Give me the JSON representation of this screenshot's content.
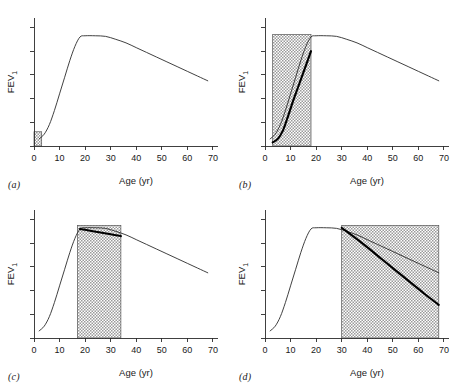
{
  "figure": {
    "panels": [
      {
        "id": "a",
        "label": "(a)",
        "xlabel": "Age (yr)",
        "ylabel": "FEV",
        "ylabel_sub": "1",
        "highlight_label": "early-life-window"
      },
      {
        "id": "b",
        "label": "(b)",
        "xlabel": "Age (yr)",
        "ylabel": "FEV",
        "ylabel_sub": "1",
        "highlight_label": "reduced-growth-window"
      },
      {
        "id": "c",
        "label": "(c)",
        "xlabel": "Age (yr)",
        "ylabel": "FEV",
        "ylabel_sub": "1",
        "highlight_label": "short-plateau-window"
      },
      {
        "id": "d",
        "label": "(d)",
        "xlabel": "Age (yr)",
        "ylabel": "FEV",
        "ylabel_sub": "1",
        "highlight_label": "accelerated-decline-window"
      }
    ]
  },
  "chart_data": [
    {
      "type": "line",
      "panel": "a",
      "title": "",
      "xlabel": "Age (yr)",
      "ylabel": "FEV1",
      "xlim": [
        0,
        72
      ],
      "ylim": [
        0,
        1.08
      ],
      "xticks": [
        0,
        10,
        20,
        30,
        40,
        50,
        60,
        70
      ],
      "xticklabels": [
        "0",
        "10",
        "20",
        "30",
        "40",
        "50",
        "60",
        "70"
      ],
      "yticks": [
        0,
        0.2,
        0.4,
        0.6,
        0.8,
        1.0
      ],
      "yticklabels": [
        "",
        "",
        "",
        "",
        "",
        ""
      ],
      "grid": false,
      "legend": false,
      "series": [
        {
          "name": "Normal FEV1 trajectory",
          "style": "thin",
          "x": [
            2,
            4,
            6,
            8,
            10,
            12,
            14,
            16,
            18,
            20,
            24,
            28,
            32,
            36,
            40,
            44,
            48,
            52,
            56,
            60,
            64,
            68
          ],
          "y": [
            0.06,
            0.1,
            0.18,
            0.3,
            0.44,
            0.58,
            0.72,
            0.84,
            0.92,
            0.93,
            0.93,
            0.925,
            0.9,
            0.87,
            0.83,
            0.79,
            0.75,
            0.71,
            0.67,
            0.63,
            0.59,
            0.55
          ]
        }
      ],
      "annotations": [
        {
          "type": "hatched-rect",
          "name": "early-life-window",
          "x_range": [
            0,
            3
          ],
          "y_range": [
            0,
            0.12
          ]
        }
      ]
    },
    {
      "type": "line",
      "panel": "b",
      "title": "",
      "xlabel": "Age (yr)",
      "ylabel": "FEV1",
      "xlim": [
        0,
        72
      ],
      "ylim": [
        0,
        1.08
      ],
      "xticks": [
        0,
        10,
        20,
        30,
        40,
        50,
        60,
        70
      ],
      "xticklabels": [
        "0",
        "10",
        "20",
        "30",
        "40",
        "50",
        "60",
        "70"
      ],
      "yticks": [
        0,
        0.2,
        0.4,
        0.6,
        0.8,
        1.0
      ],
      "yticklabels": [
        "",
        "",
        "",
        "",
        "",
        ""
      ],
      "grid": false,
      "legend": false,
      "series": [
        {
          "name": "Normal FEV1 trajectory",
          "style": "thin",
          "x": [
            2,
            4,
            6,
            8,
            10,
            12,
            14,
            16,
            18,
            20,
            24,
            28,
            32,
            36,
            40,
            44,
            48,
            52,
            56,
            60,
            64,
            68
          ],
          "y": [
            0.06,
            0.1,
            0.18,
            0.3,
            0.44,
            0.58,
            0.72,
            0.84,
            0.92,
            0.93,
            0.93,
            0.925,
            0.9,
            0.87,
            0.83,
            0.79,
            0.75,
            0.71,
            0.67,
            0.63,
            0.59,
            0.55
          ]
        },
        {
          "name": "Reduced growth trajectory",
          "style": "bold",
          "x": [
            3,
            5,
            7,
            9,
            11,
            13,
            15,
            17,
            18
          ],
          "y": [
            0.03,
            0.06,
            0.13,
            0.25,
            0.38,
            0.5,
            0.62,
            0.74,
            0.8
          ]
        }
      ],
      "annotations": [
        {
          "type": "hatched-rect",
          "name": "reduced-growth-window",
          "x_range": [
            3,
            18
          ],
          "y_range": [
            0,
            0.94
          ]
        }
      ]
    },
    {
      "type": "line",
      "panel": "c",
      "title": "",
      "xlabel": "Age (yr)",
      "ylabel": "FEV1",
      "xlim": [
        0,
        72
      ],
      "ylim": [
        0,
        1.08
      ],
      "xticks": [
        0,
        10,
        20,
        30,
        40,
        50,
        60,
        70
      ],
      "xticklabels": [
        "0",
        "10",
        "20",
        "30",
        "40",
        "50",
        "60",
        "70"
      ],
      "yticks": [
        0,
        0.2,
        0.4,
        0.6,
        0.8,
        1.0
      ],
      "yticklabels": [
        "",
        "",
        "",
        "",
        "",
        ""
      ],
      "grid": false,
      "legend": false,
      "series": [
        {
          "name": "Normal FEV1 trajectory",
          "style": "thin",
          "x": [
            2,
            4,
            6,
            8,
            10,
            12,
            14,
            16,
            18,
            20,
            24,
            28,
            32,
            36,
            40,
            44,
            48,
            52,
            56,
            60,
            64,
            68
          ],
          "y": [
            0.06,
            0.1,
            0.18,
            0.3,
            0.44,
            0.58,
            0.72,
            0.84,
            0.92,
            0.93,
            0.93,
            0.925,
            0.9,
            0.87,
            0.83,
            0.79,
            0.75,
            0.71,
            0.67,
            0.63,
            0.59,
            0.55
          ]
        },
        {
          "name": "Short plateau trajectory",
          "style": "bold",
          "x": [
            18,
            22,
            26,
            30,
            34
          ],
          "y": [
            0.92,
            0.905,
            0.89,
            0.875,
            0.86
          ]
        }
      ],
      "annotations": [
        {
          "type": "hatched-rect",
          "name": "short-plateau-window",
          "x_range": [
            17,
            34
          ],
          "y_range": [
            0,
            0.95
          ]
        }
      ]
    },
    {
      "type": "line",
      "panel": "d",
      "title": "",
      "xlabel": "Age (yr)",
      "ylabel": "FEV1",
      "xlim": [
        0,
        72
      ],
      "ylim": [
        0,
        1.08
      ],
      "xticks": [
        0,
        10,
        20,
        30,
        40,
        50,
        60,
        70
      ],
      "xticklabels": [
        "0",
        "10",
        "20",
        "30",
        "40",
        "50",
        "60",
        "70"
      ],
      "yticks": [
        0,
        0.2,
        0.4,
        0.6,
        0.8,
        1.0
      ],
      "yticklabels": [
        "",
        "",
        "",
        "",
        "",
        ""
      ],
      "grid": false,
      "legend": false,
      "series": [
        {
          "name": "Normal FEV1 trajectory",
          "style": "thin",
          "x": [
            2,
            4,
            6,
            8,
            10,
            12,
            14,
            16,
            18,
            20,
            24,
            28,
            32,
            36,
            40,
            44,
            48,
            52,
            56,
            60,
            64,
            68
          ],
          "y": [
            0.06,
            0.1,
            0.18,
            0.3,
            0.44,
            0.58,
            0.72,
            0.84,
            0.92,
            0.93,
            0.93,
            0.925,
            0.9,
            0.87,
            0.83,
            0.79,
            0.75,
            0.71,
            0.67,
            0.63,
            0.59,
            0.55
          ]
        },
        {
          "name": "Accelerated decline trajectory",
          "style": "bold",
          "x": [
            30,
            38,
            46,
            54,
            62,
            68
          ],
          "y": [
            0.93,
            0.8,
            0.66,
            0.52,
            0.38,
            0.28
          ]
        }
      ],
      "annotations": [
        {
          "type": "hatched-rect",
          "name": "accelerated-decline-window",
          "x_range": [
            30,
            68
          ],
          "y_range": [
            0,
            0.95
          ]
        }
      ]
    }
  ]
}
